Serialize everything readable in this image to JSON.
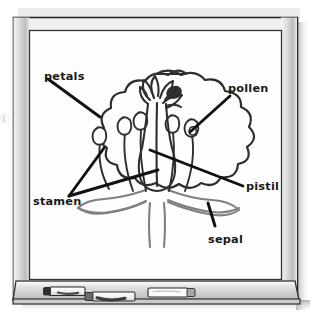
{
  "scene": {
    "kind": "whiteboard-photo",
    "surface_label": "whiteboard",
    "board_background": "#fefefe",
    "frame_color": "#c9c9c9",
    "frame_outline": "#2b2b2b",
    "tray_color": "#d2d2d2",
    "shadow_color": "#a8a8a8",
    "ink_dark": "#2e2e2e",
    "ink_gray": "#808080"
  },
  "diagram": {
    "ink_color": "#2e2e2e",
    "secondary_ink_color": "#808080",
    "parts": [
      {
        "id": "petals",
        "label": "petals"
      },
      {
        "id": "pollen",
        "label": "pollen"
      },
      {
        "id": "pistil",
        "label": "pistil"
      },
      {
        "id": "sepal",
        "label": "sepal"
      },
      {
        "id": "stamen",
        "label": "stamen"
      }
    ],
    "labels": {
      "petals": "petals",
      "pollen": "pollen",
      "pistil": "pistil",
      "sepal": "sepal",
      "stamen": "stamen"
    },
    "leader_lines": [
      {
        "from": "petals",
        "to": "petal-outline",
        "count": 1
      },
      {
        "from": "pollen",
        "to": "anther",
        "count": 1
      },
      {
        "from": "pistil",
        "to": "style",
        "count": 1
      },
      {
        "from": "sepal",
        "to": "sepal-shape",
        "count": 1
      },
      {
        "from": "stamen",
        "to": "stamen-filaments",
        "count": 2
      }
    ]
  },
  "tray": {
    "name": "marker-tray",
    "markers": [
      {
        "id": "marker-1",
        "body_color": "#f2f2f2",
        "cap_color": "#333333",
        "cap_side": "left"
      },
      {
        "id": "marker-2",
        "body_color": "#f2f2f2",
        "cap_color": "#555555",
        "cap_side": "left"
      },
      {
        "id": "marker-3",
        "body_color": "#fafafa",
        "cap_color": "#9a9a9a",
        "cap_side": "right"
      }
    ]
  }
}
